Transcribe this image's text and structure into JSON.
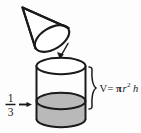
{
  "diagram": {
    "background_color": "#fdfdfd",
    "stroke_color": "#1a1a1a",
    "shaded_fill_color": "#b9b9b9",
    "unshaded_fill_color": "#ffffff",
    "shapes": {
      "cone": {
        "name": "cone",
        "orientation": "tilted, apex upper-left, circular opening lower-right"
      },
      "cylinder": {
        "name": "cylinder",
        "fill_fraction_shaded": "1/3"
      }
    },
    "labels": {
      "fraction_numerator": "1",
      "fraction_denominator": "3",
      "fraction_text": "1/3",
      "volume_formula_v": "V",
      "volume_formula_equals": "=",
      "volume_formula_pi": "π",
      "volume_formula_r": "r",
      "volume_formula_exponent": "2",
      "volume_formula_h": "h",
      "volume_formula_full": "V = πr² h"
    },
    "annotations": {
      "pour_arrow": "arrow from cone pointing down-left into cylinder",
      "fraction_arrow": "arrow from 1/3 pointing right at shaded region",
      "height_brace": "curly brace spanning full cylinder height"
    }
  }
}
